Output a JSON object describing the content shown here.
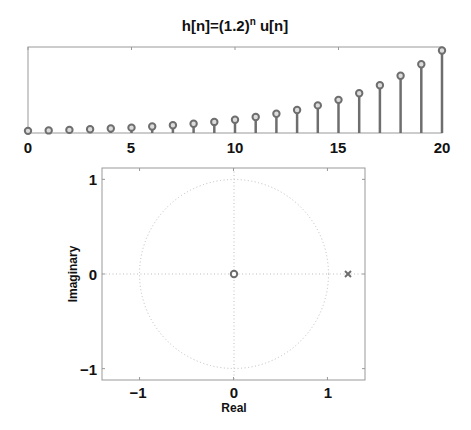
{
  "chart_data": [
    {
      "type": "stem",
      "title": "h[n]=(1.2)^n u[n]",
      "title_parts": {
        "base": "h[n]=(1.2)",
        "sup": "n",
        "tail": " u[n]"
      },
      "xlabel": "",
      "ylabel": "",
      "xlim": [
        0,
        20
      ],
      "ylim": [
        0,
        40
      ],
      "xticks": [
        0,
        5,
        10,
        15,
        20
      ],
      "yticks": [],
      "grid": false,
      "x": [
        0,
        1,
        2,
        3,
        4,
        5,
        6,
        7,
        8,
        9,
        10,
        11,
        12,
        13,
        14,
        15,
        16,
        17,
        18,
        19,
        20
      ],
      "values": [
        1.0,
        1.2,
        1.44,
        1.73,
        2.07,
        2.49,
        2.99,
        3.58,
        4.3,
        5.16,
        6.19,
        7.43,
        8.92,
        10.7,
        12.84,
        15.41,
        18.49,
        22.19,
        26.62,
        31.95,
        38.34
      ],
      "color": "#6e6e6e"
    },
    {
      "type": "scatter",
      "subtype": "pole-zero",
      "title": "",
      "xlabel": "Real",
      "ylabel": "Imaginary",
      "xlim": [
        -1.4,
        1.4
      ],
      "ylim": [
        -1.12,
        1.12
      ],
      "xticks": [
        -1,
        0,
        1
      ],
      "yticks": [
        -1,
        0,
        1
      ],
      "xtick_labels": [
        "−1",
        "0",
        "1"
      ],
      "ytick_labels": [
        "−1",
        "0",
        "1"
      ],
      "grid": "dotted axes + unit circle",
      "zeros": [
        {
          "re": 0,
          "im": 0,
          "marker": "o"
        }
      ],
      "poles": [
        {
          "re": 1.2,
          "im": 0,
          "marker": "x"
        }
      ],
      "unit_circle": true,
      "color": "#6e6e6e"
    }
  ],
  "labels": {
    "top_title_base": "h[n]=(1.2)",
    "top_title_sup": "n",
    "top_title_tail": " u[n]",
    "top_xticks": [
      "0",
      "5",
      "10",
      "15",
      "20"
    ],
    "bottom_xticks": [
      "−1",
      "0",
      "1"
    ],
    "bottom_yticks": [
      "1",
      "0",
      "−1"
    ],
    "bottom_xlabel": "Real",
    "bottom_ylabel": "Imaginary"
  }
}
